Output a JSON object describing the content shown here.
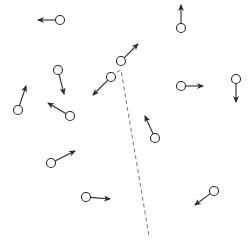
{
  "diagram": {
    "colors": {
      "stroke": "#2a2a2a",
      "dashed": "#777777",
      "background": "#ffffff"
    },
    "circle_radius": 4.5,
    "particles": [
      {
        "id": "p1",
        "cx": 60,
        "cy": 20,
        "tx": 38,
        "ty": 20
      },
      {
        "id": "p2",
        "cx": 181,
        "cy": 28,
        "tx": 181,
        "ty": 5
      },
      {
        "id": "p3",
        "cx": 121,
        "cy": 61,
        "tx": 138,
        "ty": 44
      },
      {
        "id": "p4",
        "cx": 111,
        "cy": 77,
        "tx": 93,
        "ty": 95
      },
      {
        "id": "p5",
        "cx": 58,
        "cy": 70,
        "tx": 64,
        "ty": 94
      },
      {
        "id": "p6",
        "cx": 18,
        "cy": 110,
        "tx": 26,
        "ty": 86
      },
      {
        "id": "p7",
        "cx": 70,
        "cy": 116,
        "tx": 48,
        "ty": 103
      },
      {
        "id": "p8",
        "cx": 181,
        "cy": 86,
        "tx": 203,
        "ty": 86
      },
      {
        "id": "p9",
        "cx": 236,
        "cy": 79,
        "tx": 236,
        "ty": 102
      },
      {
        "id": "p10",
        "cx": 155,
        "cy": 138,
        "tx": 145,
        "ty": 116
      },
      {
        "id": "p11",
        "cx": 51,
        "cy": 163,
        "tx": 75,
        "ty": 151
      },
      {
        "id": "p12",
        "cx": 86,
        "cy": 197,
        "tx": 110,
        "ty": 199
      },
      {
        "id": "p13",
        "cx": 214,
        "cy": 191,
        "tx": 195,
        "ty": 205
      }
    ],
    "dashed_path": [
      [
        117,
        72
      ],
      [
        121,
        70
      ],
      [
        149,
        236
      ]
    ]
  }
}
